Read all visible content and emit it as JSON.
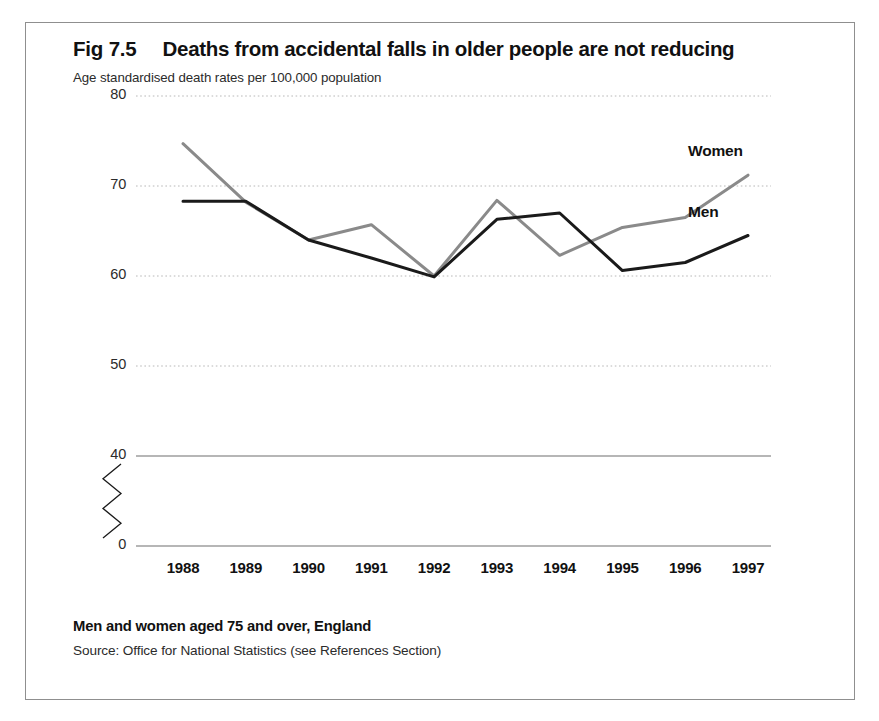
{
  "figure": {
    "number": "Fig 7.5",
    "title": "Deaths from accidental falls in older people are not reducing",
    "subtitle": "Age standardised death rates per 100,000 population",
    "caption": "Men and women aged 75 and over, England",
    "source": "Source: Office for National Statistics (see References Section)"
  },
  "colors": {
    "women_line": "#8a8a8a",
    "men_line": "#1a1a1a",
    "gridline": "#b8b8b8",
    "axis_line": "#6e6e6e",
    "frame": "#8f8f8f",
    "text": "#1a1a1a"
  },
  "chart_data": {
    "type": "line",
    "title": "Deaths from accidental falls in older people are not reducing",
    "subtitle": "Age standardised death rates per 100,000 population",
    "xlabel": "",
    "ylabel": "Age standardised death rates per 100,000 population",
    "categories": [
      1988,
      1989,
      1990,
      1991,
      1992,
      1993,
      1994,
      1995,
      1996,
      1997
    ],
    "x_tick_labels": [
      "1988",
      "1989",
      "1990",
      "1991",
      "1992",
      "1993",
      "1994",
      "1995",
      "1996",
      "1997"
    ],
    "y_tick_labels": [
      "80",
      "70",
      "60",
      "50",
      "40",
      "0"
    ],
    "y_tick_values": [
      80,
      70,
      60,
      50,
      40,
      0
    ],
    "ylim": [
      40,
      80
    ],
    "axis_break": true,
    "axis_break_note": "zigzag break between 40 and 0",
    "grid": true,
    "grid_style": "horizontal dotted",
    "legend_position": "inline-right-of-line-ends",
    "series": [
      {
        "name": "Women",
        "color": "#8a8a8a",
        "values": [
          74.7,
          68.2,
          64.0,
          65.7,
          60.0,
          68.4,
          62.3,
          65.4,
          66.5,
          71.2
        ]
      },
      {
        "name": "Men",
        "color": "#1a1a1a",
        "values": [
          68.3,
          68.3,
          64.0,
          62.0,
          59.9,
          66.3,
          67.0,
          60.6,
          61.5,
          64.5
        ]
      }
    ]
  }
}
